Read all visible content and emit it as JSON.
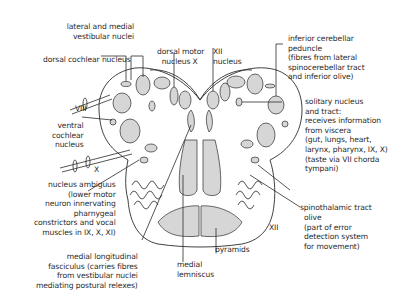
{
  "diagram": {
    "colors": {
      "outline": "#2b2b2b",
      "nucleus_fill": "#d6d6d6",
      "tract_fill": "#cfcfcf",
      "background": "#ffffff",
      "text": "#2a2a2a"
    },
    "labels": {
      "lateral_medial_vestibular": "lateral and medial\n   vestibular nuclei",
      "dorsal_cochlear": "dorsal cochlear nucleus",
      "dorsal_motor_x": "dorsal motor\n  nucleus X",
      "xii_nucleus": "XII\nnucleus",
      "inferior_cerebellar_peduncle": "inferior cerebellar\npeduncle\n(fibres from lateral\nspinocerebellar tract\nand inferior olive)",
      "nerve_viii": "VIII",
      "ventral_cochlear": "ventral\ncochlear\nnucleus",
      "solitary_nucleus": "solitary nucleus\nand tract:\nreceives information\nfrom viscera\n(gut, lungs, heart,\nlarynx, pharynx, IX, X)\n(taste via VII chorda\ntympani)",
      "nerve_x": "X",
      "nucleus_ambiguus": "nucleus ambiguus\n(lower motor\nneuron innervating\npharnygeal\nconstrictors and vocal\nmuscles in IX, X, XI)",
      "spinothalamic": "spinothalamic tract",
      "olive": "olive\n(part of error\ndetection system\nfor movement)",
      "nerve_xii": "XII",
      "pyramids": "pyramids",
      "medial_lemniscus": "medial\nlemniscus",
      "mlf": "medial longitudinal\nfasciculus (carries fibres\nfrom vestibular nuclei\nmediating postural relexes)"
    }
  }
}
